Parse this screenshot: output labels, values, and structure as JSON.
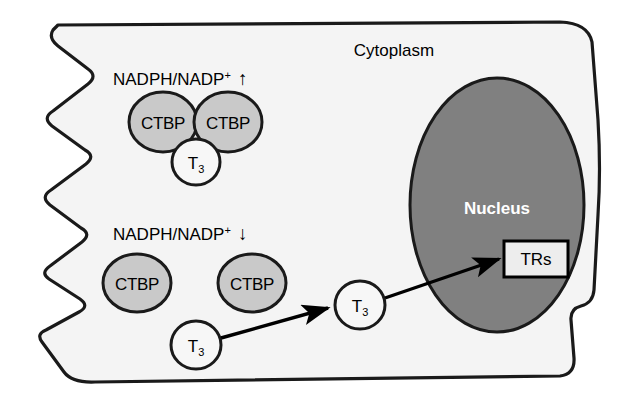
{
  "figure": {
    "type": "cell-signaling-diagram",
    "compartments": {
      "cytoplasm_label": "Cytoplasm",
      "nucleus_label": "Nucleus"
    },
    "colors": {
      "background": "#ffffff",
      "cytoplasm_fill": "#f4f4f4",
      "membrane_stroke": "#1a1a1a",
      "nucleus_fill": "#808080",
      "nucleus_stroke": "#1a1a1a",
      "ctbp_fill": "#c9c9c9",
      "ctbp_stroke": "#1a1a1a",
      "t3_fill": "#f7f7f7",
      "t3_stroke": "#1a1a1a",
      "trs_fill": "#ededed",
      "trs_stroke": "#000000",
      "arrow_stroke": "#000000",
      "nucleus_text": "#ffffff"
    },
    "states": [
      {
        "id": "high-nadph",
        "ratio_base": "NADPH/NADP",
        "ratio_superscript": "+",
        "ratio_direction_glyph": "↑",
        "ratio_direction_name": "up-arrow",
        "description_circles": [
          "CTBP",
          "CTBP",
          "T3"
        ]
      },
      {
        "id": "low-nadph",
        "ratio_base": "NADPH/NADP",
        "ratio_superscript": "+",
        "ratio_direction_glyph": "↓",
        "ratio_direction_name": "down-arrow",
        "description_circles": [
          "CTBP",
          "CTBP",
          "T3"
        ]
      }
    ],
    "nodes": {
      "ctbp_top_left": "CTBP",
      "ctbp_top_right": "CTBP",
      "t3_top": {
        "base": "T",
        "sub": "3"
      },
      "ctbp_bottom_left": "CTBP",
      "ctbp_bottom_right": "CTBP",
      "t3_free": {
        "base": "T",
        "sub": "3"
      },
      "t3_migrating": {
        "base": "T",
        "sub": "3"
      },
      "trs_box": "TRs"
    },
    "arrows": [
      {
        "name": "t3-free-to-t3-migrating",
        "from": "t3_free",
        "to": "t3_migrating"
      },
      {
        "name": "t3-migrating-to-trs",
        "from": "t3_migrating",
        "to": "trs_box"
      }
    ]
  }
}
